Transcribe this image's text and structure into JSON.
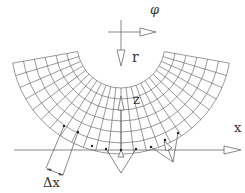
{
  "diagram": {
    "labels": {
      "phi": "φ",
      "r": "r",
      "z": "z",
      "x": "x",
      "delta_x": "Δx"
    },
    "mesh": {
      "type": "annular-sector",
      "center": [
        121,
        44
      ],
      "inner_radius": 44,
      "outer_radius": 110,
      "radial_rings": 6,
      "angle_start_deg": 10,
      "angle_end_deg": 170,
      "radial_lines": 25
    },
    "colors": {
      "line": "#555555",
      "background": "#ffffff"
    }
  }
}
